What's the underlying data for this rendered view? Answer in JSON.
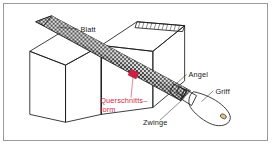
{
  "figure": {
    "border_color": "#9a9a9a",
    "background_color": "#ffffff"
  },
  "colors": {
    "wood_light": "#f2dcb2",
    "wood_face": "#edd6a8",
    "wood_shadow": "#e4c58c",
    "blade_dark": "#2e2e2e",
    "blade_light": "#d8d8d8",
    "handle": "#f0d7a8",
    "ferrule": "#2b2b2b",
    "label_black": "#1a1a1a",
    "label_red": "#cc1f44",
    "outline": "#1a1a1a"
  },
  "labels": [
    {
      "id": "blatt",
      "text": "Blatt",
      "color": "black",
      "x": 77,
      "y": 27
    },
    {
      "id": "angel",
      "text": "Angel",
      "color": "black",
      "x": 186,
      "y": 73
    },
    {
      "id": "griff",
      "text": "Griff",
      "color": "black",
      "x": 213,
      "y": 90
    },
    {
      "id": "zwinge",
      "text": "Zwinge",
      "color": "black",
      "x": 140,
      "y": 122
    },
    {
      "id": "querschnitt1",
      "text": "Querschnitts–",
      "color": "red",
      "x": 97,
      "y": 99
    },
    {
      "id": "querschnitt2",
      "text": "form",
      "color": "red",
      "x": 97,
      "y": 109
    }
  ],
  "parts": [
    {
      "id": "blatt",
      "name": "Blatt",
      "description": "Feilenblatt mit Hieb"
    },
    {
      "id": "angel",
      "name": "Angel",
      "description": "Angel der Feile"
    },
    {
      "id": "griff",
      "name": "Griff",
      "description": "Holzgriff"
    },
    {
      "id": "zwinge",
      "name": "Zwinge",
      "description": "Zwinge am Griff"
    },
    {
      "id": "querschnittsform",
      "name": "Querschnitts-form",
      "description": "Markierte Querschnittsform"
    }
  ]
}
